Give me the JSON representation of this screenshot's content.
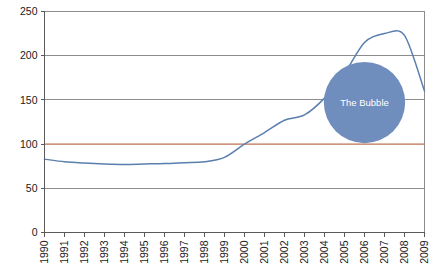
{
  "chart_data": {
    "type": "line",
    "title": "",
    "xlabel": "",
    "ylabel": "",
    "xlim": [
      1990,
      2009
    ],
    "ylim": [
      0,
      250
    ],
    "grid": true,
    "legend": "none",
    "categories": [
      "1990",
      "1991",
      "1992",
      "1993",
      "1994",
      "1995",
      "1996",
      "1997",
      "1998",
      "1999",
      "2000",
      "2001",
      "2002",
      "2003",
      "2004",
      "2005",
      "2006",
      "2007",
      "2008",
      "2009"
    ],
    "yticks": [
      0,
      50,
      100,
      150,
      200,
      250
    ],
    "series": [
      {
        "name": "Index",
        "color": "#5a7fae",
        "values": [
          83,
          80,
          78.5,
          77.5,
          77,
          77.5,
          78,
          79,
          80,
          85,
          100,
          113,
          127,
          133,
          152,
          180,
          215,
          225,
          223,
          160
        ]
      },
      {
        "name": "Baseline 100",
        "color": "#bf7050",
        "type": "reference-line",
        "value": 100
      }
    ],
    "annotations": [
      {
        "name": "bubble",
        "label": "The Bubble",
        "shape": "circle",
        "fill": "#6f8dbd",
        "text_color": "#ffffff",
        "center_x_year": 2006.0,
        "center_y_value": 147,
        "radius_value": 46
      }
    ]
  },
  "axes": {
    "y_tick_labels": [
      "250",
      "200",
      "150",
      "100",
      "50",
      "0"
    ],
    "x_tick_labels": [
      "1990",
      "1991",
      "1992",
      "1993",
      "1994",
      "1995",
      "1996",
      "1997",
      "1998",
      "1999",
      "2000",
      "2001",
      "2002",
      "2003",
      "2004",
      "2005",
      "2006",
      "2007",
      "2008",
      "2009"
    ]
  },
  "colors": {
    "series_line": "#5a7fae",
    "reference_line": "#bf7050",
    "bubble_fill": "#6f8dbd",
    "grid": "#808080",
    "axis": "#5a5a5a",
    "text": "#1a1a1a",
    "background": "#ffffff"
  }
}
